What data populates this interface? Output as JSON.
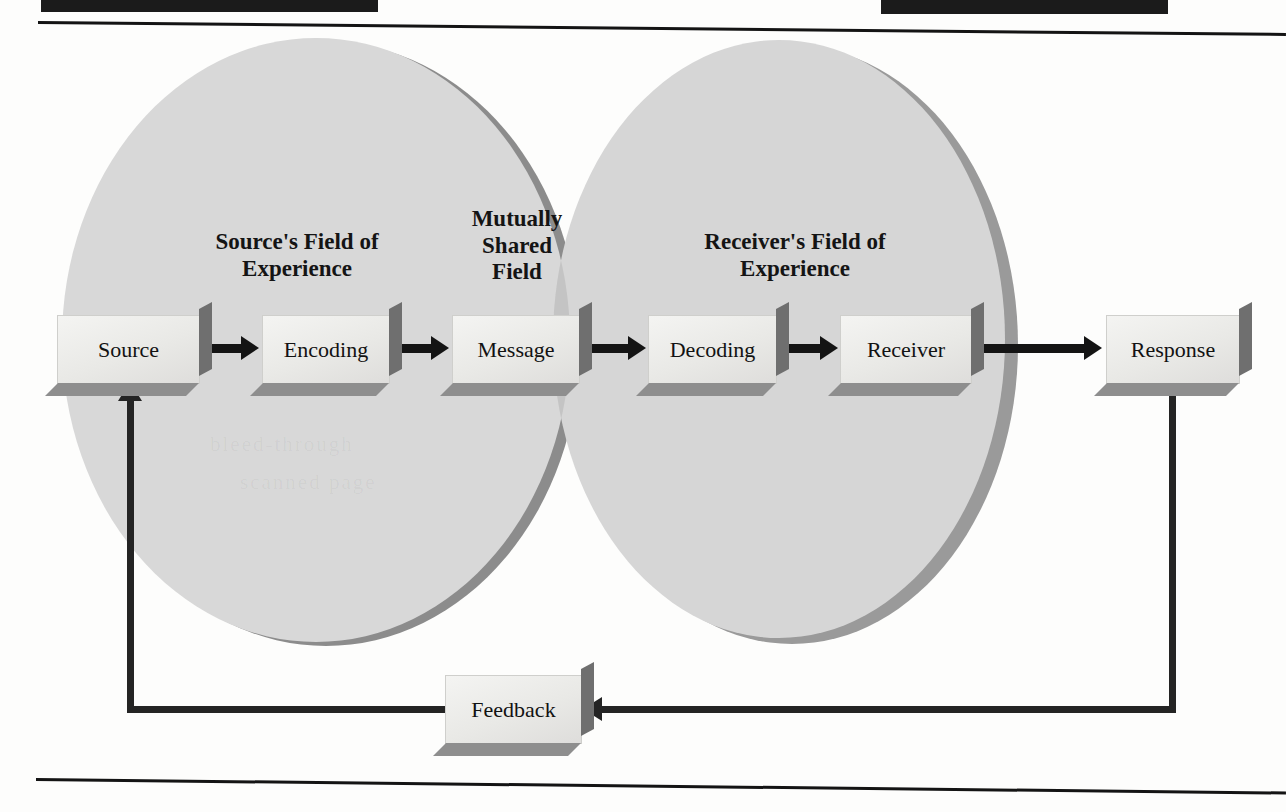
{
  "page": {
    "width": 1286,
    "height": 812,
    "background_color": "#fdfdfc",
    "ink_color": "#141414"
  },
  "diagram": {
    "type": "venn-flow-diagram",
    "fields": [
      {
        "id": "source-field",
        "label": "Source's Field of\nExperience",
        "circle": "left"
      },
      {
        "id": "shared-field",
        "label": "Mutually\nShared\nField",
        "circle": "intersection"
      },
      {
        "id": "receiver-field",
        "label": "Receiver's Field of\nExperience",
        "circle": "right"
      }
    ],
    "nodes": [
      {
        "id": "source",
        "label": "Source"
      },
      {
        "id": "encoding",
        "label": "Encoding"
      },
      {
        "id": "message",
        "label": "Message"
      },
      {
        "id": "decoding",
        "label": "Decoding"
      },
      {
        "id": "receiver",
        "label": "Receiver"
      },
      {
        "id": "response",
        "label": "Response"
      },
      {
        "id": "feedback",
        "label": "Feedback"
      }
    ],
    "flow_sequence": [
      "Source",
      "Encoding",
      "Message",
      "Decoding",
      "Receiver",
      "Response"
    ],
    "feedback_loop": {
      "from": "Response",
      "through": "Feedback",
      "to": "Source"
    },
    "colors": {
      "circle_fill": "#d8d8d8",
      "circle_shadow": "#8c8c8c",
      "intersection_fill": "#c4c4c4",
      "box_face": "#eeeeec",
      "box_extrusion": "#7d7d7d",
      "arrow": "#141414",
      "rule": "#141414",
      "header_bar": "#1b1b1b"
    }
  },
  "bleed_text": {
    "line_one": "bleed-through",
    "line_two": "scanned page"
  }
}
